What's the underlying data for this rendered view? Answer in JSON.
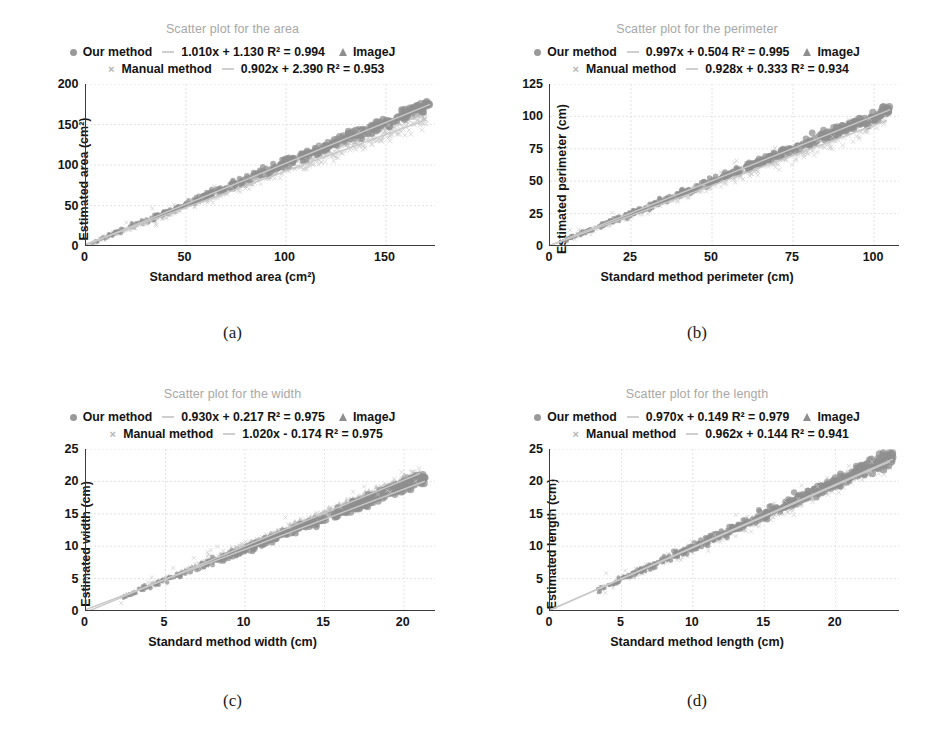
{
  "figure": {
    "legend_labels": {
      "our_method": "Our method",
      "imagej": "ImageJ",
      "manual_method": "Manual method"
    },
    "markers": {
      "our_method": "filled-circle-marker",
      "imagej": "triangle-marker",
      "manual_method": "cross-marker",
      "trendline": "dash-line"
    },
    "colors": {
      "title": "#a7a7a7",
      "our_method": "#8f8f8f",
      "imagej": "#b9b9b9",
      "manual_method": "#c9c9c9",
      "axis": "#3a3a3a",
      "grid": "#e3e3e3",
      "trendline": "#c8c8c8"
    }
  },
  "chart_data": [
    {
      "id": "a",
      "panel_label": "(a)",
      "type": "scatter",
      "title": "Scatter plot for the area",
      "xlabel": "Standard method area (cm²)",
      "ylabel": "Estimated area (cm²)",
      "xlim": [
        0,
        175
      ],
      "ylim": [
        0,
        200
      ],
      "xticks": [
        0,
        50,
        100,
        150
      ],
      "yticks": [
        0,
        50,
        100,
        150,
        200
      ],
      "grid": true,
      "legend_position": "above-plot",
      "series": [
        {
          "name": "Our method",
          "marker": "circle",
          "fit_slope": 1.01,
          "fit_intercept": 1.13,
          "fit_equation": "1.010x + 1.130 R² = 0.994",
          "r2": 0.994,
          "x_range": [
            2,
            172
          ],
          "y_range": [
            3,
            176
          ],
          "spread": 6.5,
          "n": 420
        },
        {
          "name": "ImageJ",
          "marker": "triangle",
          "x_range": [
            2,
            170
          ],
          "y_range": [
            2,
            168
          ],
          "spread": 5.0,
          "n": 260
        },
        {
          "name": "Manual method",
          "marker": "cross",
          "fit_slope": 0.902,
          "fit_intercept": 2.39,
          "fit_equation": "0.902x + 2.390 R² = 0.953",
          "r2": 0.953,
          "x_range": [
            2,
            170
          ],
          "y_range": [
            4,
            156
          ],
          "spread": 8.0,
          "n": 300
        }
      ]
    },
    {
      "id": "b",
      "panel_label": "(b)",
      "type": "scatter",
      "title": "Scatter plot for the perimeter",
      "xlabel": "Standard method perimeter (cm)",
      "ylabel": "Estimated perimeter (cm)",
      "xlim": [
        0,
        108
      ],
      "ylim": [
        0,
        125
      ],
      "xticks": [
        0,
        25,
        50,
        75,
        100
      ],
      "yticks": [
        0,
        25,
        50,
        75,
        100,
        125
      ],
      "grid": true,
      "legend_position": "above-plot",
      "series": [
        {
          "name": "Our method",
          "marker": "circle",
          "fit_slope": 0.997,
          "fit_intercept": 0.504,
          "fit_equation": "0.997x + 0.504 R² = 0.995",
          "r2": 0.995,
          "x_range": [
            4,
            105
          ],
          "y_range": [
            4,
            105
          ],
          "spread": 3.6,
          "n": 420
        },
        {
          "name": "ImageJ",
          "marker": "triangle",
          "x_range": [
            4,
            104
          ],
          "y_range": [
            4,
            103
          ],
          "spread": 3.0,
          "n": 260
        },
        {
          "name": "Manual method",
          "marker": "cross",
          "fit_slope": 0.928,
          "fit_intercept": 0.333,
          "fit_equation": "0.928x + 0.333 R² = 0.934",
          "r2": 0.934,
          "x_range": [
            4,
            104
          ],
          "y_range": [
            4,
            97
          ],
          "spread": 5.5,
          "n": 300
        }
      ]
    },
    {
      "id": "c",
      "panel_label": "(c)",
      "type": "scatter",
      "title": "Scatter plot for the width",
      "xlabel": "Standard method width (cm)",
      "ylabel": "Estimated width (cm)",
      "xlim": [
        0,
        22
      ],
      "ylim": [
        0,
        25
      ],
      "xticks": [
        0,
        5,
        10,
        15,
        20
      ],
      "yticks": [
        0,
        5,
        10,
        15,
        20,
        25
      ],
      "grid": true,
      "legend_position": "above-plot",
      "series": [
        {
          "name": "Our method",
          "marker": "circle",
          "fit_slope": 0.93,
          "fit_intercept": 0.217,
          "fit_equation": "0.930x + 0.217 R² = 0.975",
          "r2": 0.975,
          "x_range": [
            2.1,
            21.3
          ],
          "y_range": [
            2.0,
            20.5
          ],
          "spread": 0.85,
          "n": 430
        },
        {
          "name": "ImageJ",
          "marker": "triangle",
          "x_range": [
            2.1,
            21.0
          ],
          "y_range": [
            2.1,
            21.2
          ],
          "spread": 0.6,
          "n": 260
        },
        {
          "name": "Manual method",
          "marker": "cross",
          "fit_slope": 1.02,
          "fit_intercept": -0.174,
          "fit_equation": "1.020x - 0.174 R² = 0.975",
          "r2": 0.975,
          "x_range": [
            2.1,
            21.0
          ],
          "y_range": [
            2.0,
            21.0
          ],
          "spread": 0.9,
          "n": 300
        }
      ]
    },
    {
      "id": "d",
      "panel_label": "(d)",
      "type": "scatter",
      "title": "Scatter plot for the length",
      "xlabel": "Standard method length (cm)",
      "ylabel": "Estimated length (cm)",
      "xlim": [
        0,
        24.5
      ],
      "ylim": [
        0,
        25
      ],
      "xticks": [
        0,
        5,
        10,
        15,
        20
      ],
      "yticks": [
        0,
        5,
        10,
        15,
        20,
        25
      ],
      "grid": true,
      "legend_position": "above-plot",
      "series": [
        {
          "name": "Our method",
          "marker": "circle",
          "fit_slope": 0.97,
          "fit_intercept": 0.149,
          "fit_equation": "0.970x + 0.149 R² = 0.979",
          "r2": 0.979,
          "x_range": [
            3.3,
            24.0
          ],
          "y_range": [
            3.2,
            23.8
          ],
          "spread": 0.9,
          "n": 430
        },
        {
          "name": "ImageJ",
          "marker": "triangle",
          "x_range": [
            3.3,
            23.8
          ],
          "y_range": [
            3.3,
            23.5
          ],
          "spread": 0.7,
          "n": 260
        },
        {
          "name": "Manual method",
          "marker": "cross",
          "fit_slope": 0.962,
          "fit_intercept": 0.144,
          "fit_equation": "0.962x + 0.144 R² = 0.941",
          "r2": 0.941,
          "x_range": [
            3.3,
            23.8
          ],
          "y_range": [
            3.0,
            23.0
          ],
          "spread": 1.1,
          "n": 300
        }
      ]
    }
  ]
}
